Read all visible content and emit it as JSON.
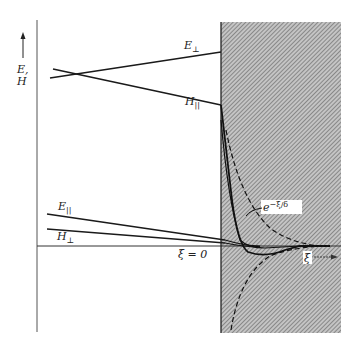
{
  "diagram": {
    "axis_label_line1": "E,",
    "axis_label_line2": "H",
    "x_axis_label": "ξ",
    "origin_label": "ξ = 0",
    "decay_label": "e",
    "decay_exponent": "−ξ/δ",
    "curves": [
      {
        "id": "E_perp",
        "symbol": "E",
        "subscript": "⊥"
      },
      {
        "id": "H_par",
        "symbol": "H",
        "subscript": "||"
      },
      {
        "id": "E_par",
        "symbol": "E",
        "subscript": "||"
      },
      {
        "id": "H_perp",
        "symbol": "H",
        "subscript": "⊥"
      }
    ],
    "colors": {
      "line": "#1a1a1a",
      "shade": "#9a9a9a",
      "background": "#ffffff"
    }
  }
}
